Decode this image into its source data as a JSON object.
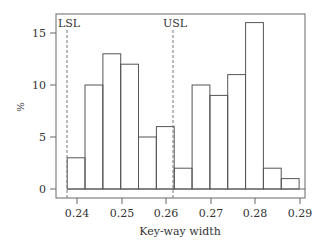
{
  "chart_data": {
    "type": "bar",
    "title": "",
    "xlabel": "Key-way width",
    "ylabel": "%",
    "xlim": [
      0.2355,
      0.291
    ],
    "ylim": [
      -1,
      16.8
    ],
    "grid": false,
    "legend": null,
    "x_ticks": [
      0.24,
      0.25,
      0.26,
      0.27,
      0.28,
      0.29
    ],
    "x_tick_labels": [
      "0.24",
      "0.25",
      "0.26",
      "0.27",
      "0.28",
      "0.29"
    ],
    "y_ticks": [
      0,
      5,
      10,
      15
    ],
    "y_tick_labels": [
      "0",
      "5",
      "10",
      "15"
    ],
    "bin_width": 0.004,
    "bin_edges": [
      0.2378,
      0.2418,
      0.2458,
      0.2498,
      0.2538,
      0.2578,
      0.2618,
      0.2658,
      0.2698,
      0.2738,
      0.2778,
      0.2818,
      0.2858,
      0.2898
    ],
    "categories": [
      "0.2378-0.2418",
      "0.2418-0.2458",
      "0.2458-0.2498",
      "0.2498-0.2538",
      "0.2538-0.2578",
      "0.2578-0.2618",
      "0.2618-0.2658",
      "0.2658-0.2698",
      "0.2698-0.2738",
      "0.2738-0.2778",
      "0.2778-0.2818",
      "0.2818-0.2858",
      "0.2858-0.2898"
    ],
    "values": [
      3,
      10,
      13,
      12,
      5,
      6,
      2,
      10,
      9,
      11,
      16,
      2,
      1
    ],
    "annotations": [
      {
        "label": "LSL",
        "x": 0.2378,
        "style": "dashed vertical line"
      },
      {
        "label": "USL",
        "x": 0.2618,
        "style": "dashed vertical line"
      }
    ]
  },
  "labels": {
    "lsl": "LSL",
    "usl": "USL",
    "xlabel": "Key-way width",
    "ylabel": "%",
    "y0": "0",
    "y5": "5",
    "y10": "10",
    "y15": "15",
    "x024": "0.24",
    "x025": "0.25",
    "x026": "0.26",
    "x027": "0.27",
    "x028": "0.28",
    "x029": "0.29"
  },
  "colors": {
    "line": "#555555",
    "text": "#333333",
    "background": "#ffffff"
  }
}
